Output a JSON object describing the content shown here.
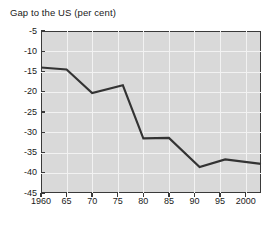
{
  "chart_data": {
    "type": "line",
    "title": "Gap to the US (per cent)",
    "xlabel": "",
    "ylabel": "",
    "xlim": [
      1960,
      2003
    ],
    "ylim": [
      -45,
      -5
    ],
    "grid": true,
    "legend": "none",
    "x_ticks": [
      1960,
      1965,
      1970,
      1975,
      1980,
      1985,
      1990,
      1995,
      2000
    ],
    "x_tick_labels": [
      "1960",
      "65",
      "70",
      "75",
      "80",
      "85",
      "90",
      "95",
      "2000"
    ],
    "y_ticks": [
      -5,
      -10,
      -15,
      -20,
      -25,
      -30,
      -35,
      -40,
      -45
    ],
    "y_tick_labels": [
      "-5",
      "-10",
      "-15",
      "-20",
      "-25",
      "-30",
      "-35",
      "-40",
      "-45"
    ],
    "series": [
      {
        "name": "Gap to the US",
        "color": "#333333",
        "x": [
          1960,
          1965,
          1970,
          1976,
          1980,
          1985,
          1991,
          1996,
          2003
        ],
        "values": [
          -14.0,
          -14.5,
          -20.3,
          -18.4,
          -31.5,
          -31.4,
          -38.6,
          -36.7,
          -37.8
        ]
      }
    ]
  },
  "axes": {
    "plot_background": "#d9d9d9",
    "gridline_color": "#f2f2f2",
    "frame_color": "#3a3a3a"
  }
}
